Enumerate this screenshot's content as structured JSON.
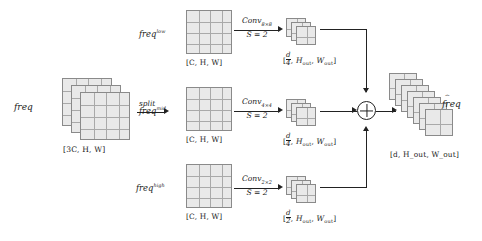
{
  "diagram": {
    "input": {
      "label": "freq",
      "shape": "[3C, H, W]",
      "planes": 3,
      "grid": "4x4"
    },
    "split": {
      "label": "split"
    },
    "branches": [
      {
        "name": "low",
        "label_base": "freq",
        "label_sup": "low",
        "shape": "[C, H, W]",
        "op_top": "Conv",
        "op_sub": "8×8",
        "op_bottom": "S = 2",
        "out_num": "d",
        "out_den": "4",
        "out_shape_rest": ", H",
        "out_shape": "H_out, W_out",
        "out_planes": 3
      },
      {
        "name": "mid",
        "label_base": "freq",
        "label_sup": "mid",
        "shape": "[C, H, W]",
        "op_top": "Conv",
        "op_sub": "4×4",
        "op_bottom": "S = 2",
        "out_num": "d",
        "out_den": "4",
        "out_shape": "H_out, W_out",
        "out_planes": 3
      },
      {
        "name": "high",
        "label_base": "freq",
        "label_sup": "high",
        "shape": "[C, H, W]",
        "op_top": "Conv",
        "op_sub": "2×2",
        "op_bottom": "S = 2",
        "out_num": "d",
        "out_den": "2",
        "out_shape": "H_out, W_out",
        "out_planes": 3
      }
    ],
    "sum": {
      "symbol": "+",
      "name": "elementwise-sum"
    },
    "output": {
      "label": "freq",
      "hat": "⌢",
      "shape": "[d, H_out, W_out]",
      "planes": 7
    },
    "colors": {
      "plane_fill": "#e9e9e9",
      "plane_stroke": "#8a8a8a",
      "line": "#222222",
      "text": "#1b1b1b",
      "background": "#ffffff"
    },
    "shape_pieces": {
      "bracket_open": "[",
      "bracket_close": "]",
      "comma": ",",
      "H_out": "H",
      "W_out": "W",
      "out_sub": "out",
      "d": "d",
      "C": "C",
      "threeC": "3C",
      "H": "H",
      "W": "W"
    }
  }
}
